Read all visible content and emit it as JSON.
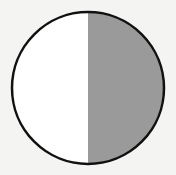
{
  "diagram": {
    "type": "fraction-circle",
    "parts_total": 2,
    "parts_shaded": 1,
    "fraction_shaded": "1/2",
    "shaded_side": "right",
    "colors": {
      "background": "#f4f4f2",
      "unshaded": "#ffffff",
      "shaded": "#9a9a9a",
      "outline": "#111111"
    },
    "geometry": {
      "cx": 88,
      "cy": 88,
      "r": 76,
      "divider_x": 88
    }
  }
}
